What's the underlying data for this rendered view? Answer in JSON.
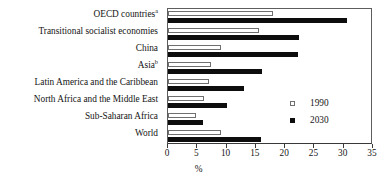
{
  "chart_data": {
    "type": "bar",
    "orientation": "horizontal",
    "title": "",
    "xlabel": "%",
    "ylabel": "",
    "xlim": [
      0,
      35
    ],
    "xticks": [
      0,
      5,
      10,
      15,
      20,
      25,
      30,
      35
    ],
    "grid": false,
    "legend_position": "middle-right",
    "categories": [
      "OECD countries",
      "Transitional socialist economies",
      "China",
      "Asia",
      "Latin America and the Caribbean",
      "North Africa and the Middle East",
      "Sub-Saharan Africa",
      "World"
    ],
    "category_footnotes": [
      "a",
      "",
      "",
      "b",
      "",
      "",
      "",
      ""
    ],
    "series": [
      {
        "name": "1990",
        "color": "#ffffff",
        "edge_color": "#6f6f6f",
        "values": [
          18.0,
          15.5,
          9.0,
          7.3,
          7.0,
          6.2,
          4.8,
          9.0
        ]
      },
      {
        "name": "2030",
        "color": "#0d0d0d",
        "edge_color": "#0d0d0d",
        "values": [
          30.5,
          22.4,
          22.2,
          16.0,
          13.0,
          10.0,
          6.0,
          15.9
        ]
      }
    ]
  },
  "legend": {
    "items": [
      {
        "label": "1990",
        "swatch": "hollow-square"
      },
      {
        "label": "2030",
        "swatch": "filled-square"
      }
    ]
  },
  "axis": {
    "x_title": "%",
    "tick_labels": [
      "0",
      "5",
      "10",
      "15",
      "20",
      "25",
      "30",
      "35"
    ]
  }
}
